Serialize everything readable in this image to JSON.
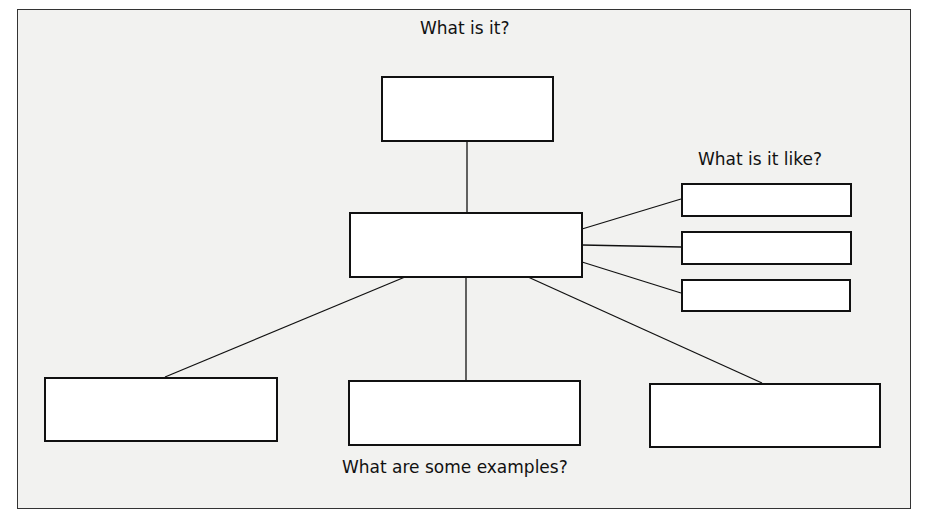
{
  "diagram": {
    "type": "concept-map",
    "labels": {
      "top": "What is it?",
      "right": "What is it like?",
      "bottom": "What are some examples?"
    },
    "boxes": {
      "definition": "",
      "center": "",
      "properties": [
        "",
        "",
        ""
      ],
      "examples": [
        "",
        "",
        ""
      ]
    },
    "colors": {
      "line": "#111111",
      "background": "#f2f2f0",
      "box_fill": "#ffffff"
    }
  }
}
